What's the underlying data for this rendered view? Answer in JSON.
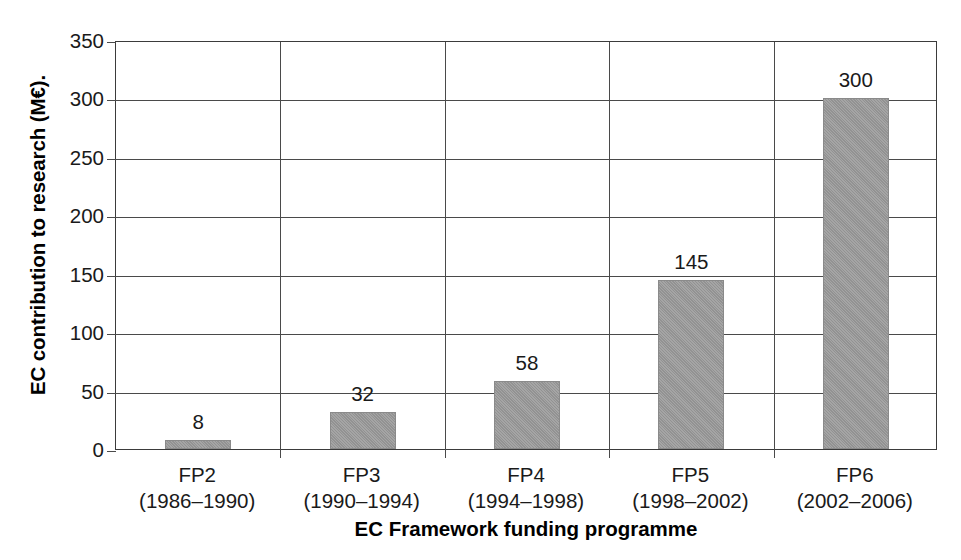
{
  "chart_data": {
    "type": "bar",
    "title": "",
    "xlabel": "EC Framework funding programme",
    "ylabel": "EC contribution to research (M€).",
    "categories": [
      "FP2",
      "FP3",
      "FP4",
      "FP5",
      "FP6"
    ],
    "category_sublabels": [
      "(1986–1990)",
      "(1990–1994)",
      "(1994–1998)",
      "(1998–2002)",
      "(2002–2006)"
    ],
    "values": [
      8,
      32,
      58,
      145,
      300
    ],
    "value_labels": [
      "8",
      "32",
      "58",
      "145",
      "300"
    ],
    "ylim": [
      0,
      350
    ],
    "yticks": [
      0,
      50,
      100,
      150,
      200,
      250,
      300,
      350
    ],
    "ytick_labels": [
      "0",
      "50",
      "100",
      "150",
      "200",
      "250",
      "300",
      "350"
    ],
    "grid": "horizontal-and-category-separators",
    "legend": "none",
    "bar_color": "#9a9a9a",
    "axis_color": "#4a4a4a",
    "text_color": "#1a1a1a"
  }
}
